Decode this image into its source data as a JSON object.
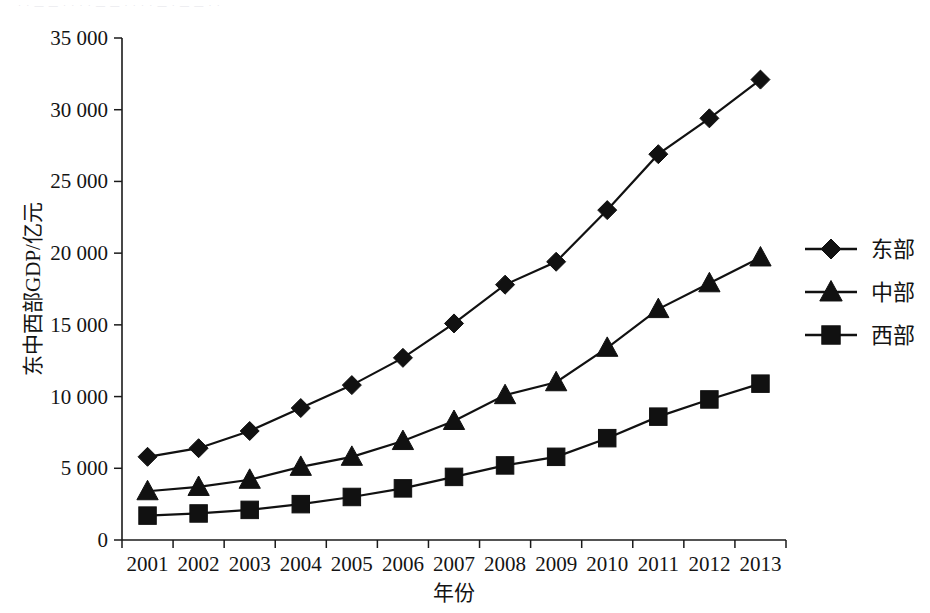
{
  "figure": {
    "scan_artifact_text": "· · — — · · · · — — · · · · — · — — · ·"
  },
  "chart_data": {
    "type": "line",
    "title": "",
    "subtitle": "",
    "xlabel": "年份",
    "ylabel": "东中西部GDP/亿元",
    "x": [
      2001,
      2002,
      2003,
      2004,
      2005,
      2006,
      2007,
      2008,
      2009,
      2010,
      2011,
      2012,
      2013
    ],
    "categories": [
      "2001",
      "2002",
      "2003",
      "2004",
      "2005",
      "2006",
      "2007",
      "2008",
      "2009",
      "2010",
      "2011",
      "2012",
      "2013"
    ],
    "xlim": [
      2000.5,
      2013.5
    ],
    "ylim": [
      0,
      35000
    ],
    "yticks": [
      0,
      5000,
      10000,
      15000,
      20000,
      25000,
      30000,
      35000
    ],
    "ytick_labels": [
      "0",
      "5 000",
      "10 000",
      "15 000",
      "20 000",
      "25 000",
      "30 000",
      "35 000"
    ],
    "grid": false,
    "legend_position": "right",
    "series": [
      {
        "name": "东部",
        "marker": "diamond",
        "color": "#111111",
        "values": [
          5800,
          6400,
          7600,
          9200,
          10800,
          12700,
          15100,
          17800,
          19400,
          23000,
          26900,
          29400,
          32100
        ]
      },
      {
        "name": "中部",
        "marker": "triangle",
        "color": "#111111",
        "values": [
          3400,
          3700,
          4200,
          5100,
          5800,
          6900,
          8300,
          10100,
          11000,
          13400,
          16100,
          17900,
          19700
        ]
      },
      {
        "name": "西部",
        "marker": "square",
        "color": "#111111",
        "values": [
          1700,
          1850,
          2100,
          2500,
          3000,
          3600,
          4400,
          5200,
          5800,
          7100,
          8600,
          9800,
          10900
        ]
      }
    ]
  },
  "axis": {
    "y_title": "东中西部GDP/亿元",
    "x_title": "年份"
  },
  "legend": {
    "items": [
      {
        "label": "东部",
        "marker": "diamond-marker-icon"
      },
      {
        "label": "中部",
        "marker": "triangle-marker-icon"
      },
      {
        "label": "西部",
        "marker": "square-marker-icon"
      }
    ]
  }
}
